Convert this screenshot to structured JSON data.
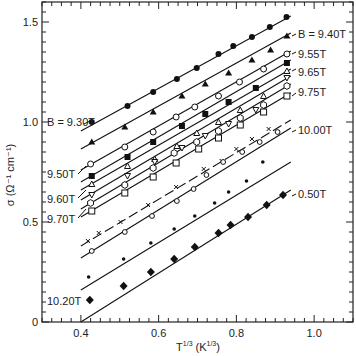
{
  "chart_data": {
    "type": "scatter",
    "title": "",
    "xlabel": "T^(1/3) (K^(1/3))",
    "ylabel": "σ (Ω⁻¹ cm⁻¹)",
    "xlim": [
      0.3,
      1.1
    ],
    "ylim": [
      0,
      1.6
    ],
    "xticks": [
      0.4,
      0.6,
      0.8,
      1.0
    ],
    "xtick_labels": [
      "0.4",
      "0.6",
      "0.8",
      "1.0"
    ],
    "yticks": [
      0,
      0.5,
      1.0,
      1.5
    ],
    "ytick_labels": [
      "0",
      "0.5",
      "1.0",
      "1.5"
    ],
    "grid": false,
    "legend": "inline labels",
    "series": [
      {
        "name": "9.30T",
        "label": "B = 9.30T",
        "label_side": "left",
        "marker": "filled-circle",
        "x": [
          0.428,
          0.52,
          0.586,
          0.647,
          0.698,
          0.754,
          0.792,
          0.84,
          0.886,
          0.929
        ],
        "y": [
          1.0,
          1.08,
          1.15,
          1.215,
          1.27,
          1.34,
          1.38,
          1.425,
          1.475,
          1.525
        ],
        "fit": [
          [
            0.4,
            0.955
          ],
          [
            0.94,
            1.53
          ]
        ]
      },
      {
        "name": "9.40T",
        "label": "B = 9.40T",
        "label_side": "right",
        "marker": "filled-triangle",
        "x": [
          0.428,
          0.513,
          0.586,
          0.66,
          0.72,
          0.78,
          0.84,
          0.888,
          0.93
        ],
        "y": [
          0.9,
          0.975,
          1.05,
          1.13,
          1.19,
          1.245,
          1.31,
          1.36,
          1.43
        ],
        "fit": [
          [
            0.4,
            0.865
          ],
          [
            0.94,
            1.445
          ]
        ]
      },
      {
        "name": "9.50T",
        "label": "9.50T",
        "label_side": "left",
        "marker": "open-circle",
        "x": [
          0.425,
          0.513,
          0.586,
          0.645,
          0.693,
          0.754,
          0.808,
          0.87,
          0.93
        ],
        "y": [
          0.79,
          0.875,
          0.95,
          1.025,
          1.075,
          1.13,
          1.2,
          1.265,
          1.34
        ],
        "fit": [
          [
            0.4,
            0.76
          ],
          [
            0.94,
            1.355
          ]
        ]
      },
      {
        "name": "9.55T",
        "label": "9.55T",
        "label_side": "right",
        "marker": "filled-square",
        "x": [
          0.428,
          0.52,
          0.586,
          0.66,
          0.72,
          0.78,
          0.85,
          0.93
        ],
        "y": [
          0.73,
          0.825,
          0.9,
          0.98,
          1.04,
          1.1,
          1.17,
          1.295
        ],
        "fit": [
          [
            0.4,
            0.7
          ],
          [
            0.94,
            1.31
          ]
        ]
      },
      {
        "name": "9.60T",
        "label": "9.60T",
        "label_side": "left",
        "marker": "open-triangle",
        "x": [
          0.428,
          0.52,
          0.59,
          0.647,
          0.698,
          0.754,
          0.81,
          0.87,
          0.93
        ],
        "y": [
          0.69,
          0.78,
          0.815,
          0.88,
          0.945,
          1.0,
          1.06,
          1.13,
          1.255
        ],
        "fit": [
          [
            0.4,
            0.66
          ],
          [
            0.94,
            1.265
          ]
        ]
      },
      {
        "name": "9.65T",
        "label": "9.65T",
        "label_side": "right",
        "marker": "open-inverted-triangle",
        "x": [
          0.428,
          0.52,
          0.59,
          0.66,
          0.72,
          0.78,
          0.85,
          0.93
        ],
        "y": [
          0.635,
          0.73,
          0.8,
          0.87,
          0.93,
          0.99,
          1.06,
          1.22
        ],
        "fit": [
          [
            0.4,
            0.61
          ],
          [
            0.94,
            1.23
          ]
        ]
      },
      {
        "name": "9.70T",
        "label": "9.70T",
        "label_side": "left",
        "marker": "open-hexagon",
        "x": [
          0.425,
          0.513,
          0.586,
          0.64,
          0.698,
          0.754,
          0.81,
          0.87,
          0.93
        ],
        "y": [
          0.595,
          0.685,
          0.77,
          0.845,
          0.9,
          0.955,
          1.02,
          1.085,
          1.18
        ],
        "fit": [
          [
            0.4,
            0.565
          ],
          [
            0.94,
            1.19
          ]
        ]
      },
      {
        "name": "9.75T",
        "label": "9.75T",
        "label_side": "right",
        "marker": "open-square",
        "x": [
          0.428,
          0.513,
          0.586,
          0.645,
          0.703,
          0.754,
          0.81,
          0.87,
          0.93
        ],
        "y": [
          0.555,
          0.645,
          0.725,
          0.795,
          0.865,
          0.92,
          0.985,
          1.05,
          1.13
        ],
        "fit": [
          [
            0.4,
            0.525
          ],
          [
            0.94,
            1.145
          ]
        ]
      },
      {
        "name": "x-series",
        "label": "",
        "label_side": "none",
        "marker": "cross",
        "x": [
          0.418,
          0.446,
          0.502,
          0.573,
          0.645,
          0.716,
          0.762,
          0.8,
          0.84,
          0.883
        ],
        "y": [
          0.405,
          0.445,
          0.5,
          0.585,
          0.675,
          0.765,
          0.805,
          0.865,
          0.915,
          0.965
        ],
        "fit": [
          [
            0.4,
            0.38
          ],
          [
            0.94,
            1.01
          ]
        ]
      },
      {
        "name": "10.00T",
        "label": "10.00T",
        "label_side": "right",
        "marker": "small-open-circle",
        "x": [
          0.428,
          0.513,
          0.583,
          0.647,
          0.69,
          0.723,
          0.766,
          0.815,
          0.86,
          0.906
        ],
        "y": [
          0.355,
          0.45,
          0.53,
          0.605,
          0.665,
          0.735,
          0.8,
          0.85,
          0.9,
          0.95
        ],
        "fit": [
          [
            0.4,
            0.32
          ],
          [
            0.94,
            0.97
          ]
        ]
      },
      {
        "name": "small-dot-series",
        "label": "",
        "label_side": "none",
        "marker": "small-filled-circle",
        "x": [
          0.42,
          0.51,
          0.58,
          0.64,
          0.693,
          0.744,
          0.78,
          0.826,
          0.868
        ],
        "y": [
          0.225,
          0.315,
          0.395,
          0.465,
          0.53,
          0.595,
          0.65,
          0.705,
          0.8
        ],
        "fit": [
          [
            0.4,
            0.16
          ],
          [
            0.94,
            0.8
          ]
        ]
      },
      {
        "name": "10.20T",
        "label": "10.20T",
        "label_side": "left",
        "marker": "filled-diamond",
        "x": [
          0.423,
          0.51,
          0.58,
          0.64,
          0.693,
          0.754,
          0.785,
          0.83,
          0.878,
          0.92
        ],
        "y": [
          0.11,
          0.18,
          0.25,
          0.315,
          0.375,
          0.445,
          0.485,
          0.525,
          0.585,
          0.635
        ],
        "fit": [
          [
            0.4,
            0.0
          ],
          [
            0.94,
            0.66
          ]
        ]
      },
      {
        "name": "0.50T",
        "label": "0.50T",
        "label_side": "right",
        "marker": "none",
        "x": [],
        "y": [],
        "fit": []
      }
    ]
  },
  "labels": {
    "y_axis": "σ (Ω⁻¹ cm⁻¹)",
    "x_axis_base": "T",
    "x_axis_exp": "1/3",
    "x_axis_unit": "(K",
    "x_axis_unit_exp": "1/3",
    "x_axis_close": ")"
  }
}
